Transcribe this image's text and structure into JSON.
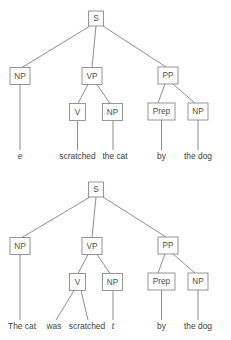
{
  "trees": [
    {
      "id": "tree-deep-structure",
      "nodes": {
        "s": {
          "label": "S",
          "x": 96,
          "y": 18.5,
          "w": 15,
          "h": 15
        },
        "np_subj": {
          "label": "NP",
          "x": 20,
          "y": 76,
          "w": 20,
          "h": 17
        },
        "vp": {
          "label": "VP",
          "x": 92,
          "y": 76,
          "w": 20,
          "h": 17
        },
        "pp": {
          "label": "PP",
          "x": 168,
          "y": 75.5,
          "w": 20,
          "h": 17
        },
        "v": {
          "label": "V",
          "x": 77.5,
          "y": 112,
          "w": 16,
          "h": 17
        },
        "np_obj": {
          "label": "NP",
          "x": 112,
          "y": 112,
          "w": 20,
          "h": 17
        },
        "prep": {
          "label": "Prep",
          "x": 161.5,
          "y": 111.5,
          "w": 27,
          "h": 17
        },
        "np_obl": {
          "label": "NP",
          "x": 198,
          "y": 111.5,
          "w": 20,
          "h": 17
        }
      },
      "leaves": [
        {
          "name": "leaf-empty-subject",
          "text": "e",
          "x": 20,
          "y": 159,
          "italic": true
        },
        {
          "name": "leaf-scratched",
          "text": "scratched",
          "x": 77.5,
          "y": 159,
          "italic": false
        },
        {
          "name": "leaf-the-cat",
          "text": "the cat",
          "x": 115,
          "y": 159,
          "italic": false
        },
        {
          "name": "leaf-by",
          "text": "by",
          "x": 161.5,
          "y": 159,
          "italic": false
        },
        {
          "name": "leaf-the-dog",
          "text": "the dog",
          "x": 198,
          "y": 159,
          "italic": false
        }
      ]
    },
    {
      "id": "tree-surface-structure",
      "nodes": {
        "s": {
          "label": "S",
          "x": 96,
          "y": 189.5,
          "w": 15,
          "h": 15
        },
        "np_subj": {
          "label": "NP",
          "x": 20,
          "y": 246,
          "w": 20,
          "h": 17
        },
        "vp": {
          "label": "VP",
          "x": 92,
          "y": 246,
          "w": 20,
          "h": 17
        },
        "pp": {
          "label": "PP",
          "x": 168,
          "y": 245.5,
          "w": 20,
          "h": 17
        },
        "v": {
          "label": "V",
          "x": 77.5,
          "y": 282,
          "w": 16,
          "h": 17
        },
        "np_obj": {
          "label": "NP",
          "x": 112,
          "y": 282,
          "w": 20,
          "h": 17
        },
        "prep": {
          "label": "Prep",
          "x": 161.5,
          "y": 281.5,
          "w": 27,
          "h": 17
        },
        "np_obl": {
          "label": "NP",
          "x": 198,
          "y": 281.5,
          "w": 20,
          "h": 17
        }
      },
      "leaves": [
        {
          "name": "leaf-the-cat-subject",
          "text": "The cat",
          "x": 22,
          "y": 329,
          "italic": false
        },
        {
          "name": "leaf-was",
          "text": "was",
          "x": 54,
          "y": 329,
          "italic": false
        },
        {
          "name": "leaf-scratched",
          "text": "scratched",
          "x": 87,
          "y": 329,
          "italic": false
        },
        {
          "name": "leaf-trace",
          "text": "t",
          "x": 113,
          "y": 329,
          "italic": true
        },
        {
          "name": "leaf-by",
          "text": "by",
          "x": 161.5,
          "y": 329,
          "italic": false
        },
        {
          "name": "leaf-the-dog",
          "text": "the dog",
          "x": 198,
          "y": 329,
          "italic": false
        }
      ]
    }
  ],
  "colors": {
    "background": "#ffffff",
    "edge": "#808080",
    "box_stroke": "#8a8a8a",
    "node_text": "#4d4d4d",
    "leaf_text": "#3d3d3d"
  }
}
